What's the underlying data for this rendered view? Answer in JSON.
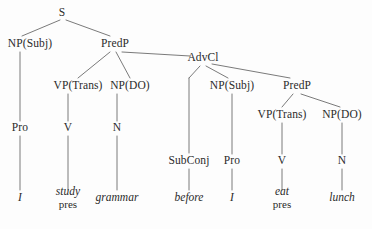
{
  "diagram": {
    "type": "syntax-tree",
    "sentence": "I study grammar before I eat lunch",
    "line_color": "#6b6b6b",
    "text_color": "#2b2b2b",
    "background_color": "#fdfdfd",
    "nodes": [
      {
        "id": "s",
        "label": "S",
        "x": 62,
        "y": 13
      },
      {
        "id": "np_subj_main",
        "label": "NP(Subj)",
        "x": 30,
        "y": 44
      },
      {
        "id": "predp_main",
        "label": "PredP",
        "x": 115,
        "y": 44
      },
      {
        "id": "vp_trans_main",
        "label": "VP(Trans)",
        "x": 78,
        "y": 86
      },
      {
        "id": "np_do_main",
        "label": "NP(DO)",
        "x": 130,
        "y": 86
      },
      {
        "id": "advcl",
        "label": "AdvCl",
        "x": 203,
        "y": 58
      },
      {
        "id": "np_subj_sub",
        "label": "NP(Subj)",
        "x": 232,
        "y": 86
      },
      {
        "id": "predp_sub",
        "label": "PredP",
        "x": 297,
        "y": 86
      },
      {
        "id": "vp_trans_sub",
        "label": "VP(Trans)",
        "x": 282,
        "y": 115
      },
      {
        "id": "np_do_sub",
        "label": "NP(DO)",
        "x": 342,
        "y": 115
      },
      {
        "id": "pro_main",
        "label": "Pro",
        "x": 20,
        "y": 128
      },
      {
        "id": "v_main",
        "label": "V",
        "x": 68,
        "y": 128
      },
      {
        "id": "n_main",
        "label": "N",
        "x": 117,
        "y": 128
      },
      {
        "id": "subconj",
        "label": "SubConj",
        "x": 189,
        "y": 161
      },
      {
        "id": "pro_sub",
        "label": "Pro",
        "x": 232,
        "y": 161
      },
      {
        "id": "v_sub",
        "label": "V",
        "x": 282,
        "y": 161
      },
      {
        "id": "n_sub",
        "label": "N",
        "x": 342,
        "y": 161
      }
    ],
    "leaves": [
      {
        "id": "leaf_i_main",
        "word": "I",
        "gloss": "",
        "x": 20,
        "y": 198
      },
      {
        "id": "leaf_study",
        "word": "study",
        "gloss": "pres",
        "x": 68,
        "y": 198
      },
      {
        "id": "leaf_grammar",
        "word": "grammar",
        "gloss": "",
        "x": 117,
        "y": 198
      },
      {
        "id": "leaf_before",
        "word": "before",
        "gloss": "",
        "x": 189,
        "y": 198
      },
      {
        "id": "leaf_i_sub",
        "word": "I",
        "gloss": "",
        "x": 232,
        "y": 198
      },
      {
        "id": "leaf_eat",
        "word": "eat",
        "gloss": "pres",
        "x": 282,
        "y": 198
      },
      {
        "id": "leaf_lunch",
        "word": "lunch",
        "gloss": "",
        "x": 342,
        "y": 198
      }
    ],
    "edges": [
      {
        "from": "s",
        "to": "np_subj_main",
        "x1": 60,
        "y1": 20,
        "x2": 22,
        "y2": 36
      },
      {
        "from": "s",
        "to": "predp_main",
        "x1": 66,
        "y1": 20,
        "x2": 110,
        "y2": 36
      },
      {
        "from": "np_subj_main",
        "to": "pro_main",
        "x1": 20,
        "y1": 52,
        "x2": 20,
        "y2": 121
      },
      {
        "from": "predp_main",
        "to": "vp_trans_main",
        "x1": 110,
        "y1": 52,
        "x2": 78,
        "y2": 78
      },
      {
        "from": "predp_main",
        "to": "np_do_main",
        "x1": 116,
        "y1": 52,
        "x2": 130,
        "y2": 78
      },
      {
        "from": "predp_main",
        "to": "advcl",
        "x1": 122,
        "y1": 52,
        "x2": 190,
        "y2": 56
      },
      {
        "from": "vp_trans_main",
        "to": "v_main",
        "x1": 68,
        "y1": 94,
        "x2": 68,
        "y2": 121
      },
      {
        "from": "np_do_main",
        "to": "n_main",
        "x1": 117,
        "y1": 94,
        "x2": 117,
        "y2": 121
      },
      {
        "from": "advcl",
        "to": "subconj_bend",
        "x1": 200,
        "y1": 66,
        "x2": 189,
        "y2": 78
      },
      {
        "from": "subconj_bend",
        "to": "subconj",
        "x1": 189,
        "y1": 78,
        "x2": 189,
        "y2": 153
      },
      {
        "from": "advcl",
        "to": "np_subj_sub",
        "x1": 206,
        "y1": 66,
        "x2": 228,
        "y2": 78
      },
      {
        "from": "advcl",
        "to": "predp_sub",
        "x1": 212,
        "y1": 64,
        "x2": 290,
        "y2": 78
      },
      {
        "from": "np_subj_sub",
        "to": "pro_sub",
        "x1": 232,
        "y1": 94,
        "x2": 232,
        "y2": 154
      },
      {
        "from": "predp_sub",
        "to": "vp_trans_sub",
        "x1": 293,
        "y1": 94,
        "x2": 282,
        "y2": 107
      },
      {
        "from": "predp_sub",
        "to": "np_do_sub",
        "x1": 301,
        "y1": 94,
        "x2": 340,
        "y2": 107
      },
      {
        "from": "vp_trans_sub",
        "to": "v_sub",
        "x1": 282,
        "y1": 123,
        "x2": 282,
        "y2": 154
      },
      {
        "from": "np_do_sub",
        "to": "n_sub",
        "x1": 342,
        "y1": 123,
        "x2": 342,
        "y2": 154
      },
      {
        "from": "pro_main",
        "to": "leaf_i_main",
        "x1": 20,
        "y1": 136,
        "x2": 20,
        "y2": 190
      },
      {
        "from": "v_main",
        "to": "leaf_study",
        "x1": 68,
        "y1": 136,
        "x2": 68,
        "y2": 190
      },
      {
        "from": "n_main",
        "to": "leaf_grammar",
        "x1": 117,
        "y1": 136,
        "x2": 117,
        "y2": 190
      },
      {
        "from": "subconj",
        "to": "leaf_before",
        "x1": 189,
        "y1": 169,
        "x2": 189,
        "y2": 190
      },
      {
        "from": "pro_sub",
        "to": "leaf_i_sub",
        "x1": 232,
        "y1": 169,
        "x2": 232,
        "y2": 190
      },
      {
        "from": "v_sub",
        "to": "leaf_eat",
        "x1": 282,
        "y1": 169,
        "x2": 282,
        "y2": 190
      },
      {
        "from": "n_sub",
        "to": "leaf_lunch",
        "x1": 342,
        "y1": 169,
        "x2": 342,
        "y2": 190
      }
    ]
  }
}
